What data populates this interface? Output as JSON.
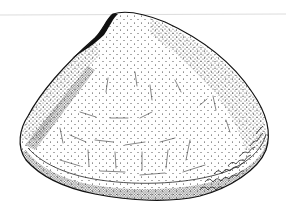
{
  "image": {
    "subject": "Stippled scientific illustration of a bivalve shell (exterior valve view)",
    "style": "black ink stipple drawing on white background",
    "colors": {
      "background": "#ffffff",
      "ink": "#111111",
      "guide_line": "#d8d8d8"
    }
  }
}
